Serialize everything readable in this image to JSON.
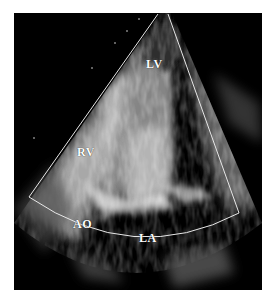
{
  "image": {
    "type": "echocardiogram",
    "view": "apical four-chamber style sector",
    "labels": {
      "lv": "LV",
      "rv": "RV",
      "ao": "AO",
      "la": "LA"
    },
    "colors": {
      "background": "#000000",
      "page": "#ffffff",
      "sector_outline": "#e8e8e8",
      "label_text": "#ffffff"
    }
  }
}
